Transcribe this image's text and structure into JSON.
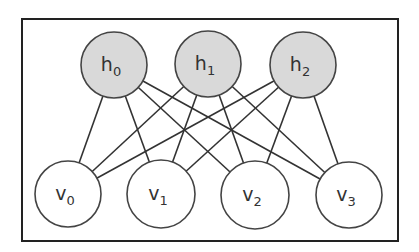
{
  "diagram": {
    "type": "bipartite-graph",
    "frame": {
      "x": 22,
      "y": 19,
      "width": 376,
      "height": 222,
      "stroke": "#222222"
    },
    "colors": {
      "hidden_fill": "#d9d9d9",
      "visible_fill": "#ffffff",
      "node_stroke": "#444444",
      "edge_stroke": "#333333",
      "label": "#333333"
    },
    "hidden_nodes": [
      {
        "id": "h0",
        "base": "h",
        "sub": "0",
        "cx": 114,
        "cy": 65,
        "r": 33
      },
      {
        "id": "h1",
        "base": "h",
        "sub": "1",
        "cx": 208,
        "cy": 64,
        "r": 33
      },
      {
        "id": "h2",
        "base": "h",
        "sub": "2",
        "cx": 303,
        "cy": 65,
        "r": 33
      }
    ],
    "visible_nodes": [
      {
        "id": "v0",
        "base": "v",
        "sub": "0",
        "cx": 68,
        "cy": 194,
        "r": 33
      },
      {
        "id": "v1",
        "base": "v",
        "sub": "1",
        "cx": 161,
        "cy": 194,
        "r": 34
      },
      {
        "id": "v2",
        "base": "v",
        "sub": "2",
        "cx": 255,
        "cy": 195,
        "r": 34
      },
      {
        "id": "v3",
        "base": "v",
        "sub": "3",
        "cx": 349,
        "cy": 195,
        "r": 33
      }
    ],
    "edges": [
      [
        "h0",
        "v0"
      ],
      [
        "h0",
        "v1"
      ],
      [
        "h0",
        "v2"
      ],
      [
        "h0",
        "v3"
      ],
      [
        "h1",
        "v0"
      ],
      [
        "h1",
        "v1"
      ],
      [
        "h1",
        "v2"
      ],
      [
        "h1",
        "v3"
      ],
      [
        "h2",
        "v0"
      ],
      [
        "h2",
        "v1"
      ],
      [
        "h2",
        "v2"
      ],
      [
        "h2",
        "v3"
      ]
    ]
  }
}
